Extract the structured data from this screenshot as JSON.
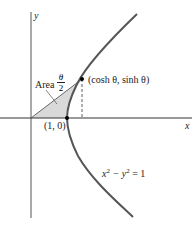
{
  "diagram": {
    "axes": {
      "x_label": "x",
      "y_label": "y"
    },
    "labels": {
      "area_word": "Area",
      "area_num": "θ",
      "area_den": "2",
      "point": "(cosh θ,  sinh θ)",
      "vertex": "(1, 0)",
      "equation_x": "x",
      "equation_sup1": "2",
      "equation_mid": " − y",
      "equation_sup2": "2",
      "equation_end": " = 1"
    },
    "colors": {
      "curve": "#555555",
      "fill": "#d9d9d9",
      "axis": "#333333"
    }
  }
}
